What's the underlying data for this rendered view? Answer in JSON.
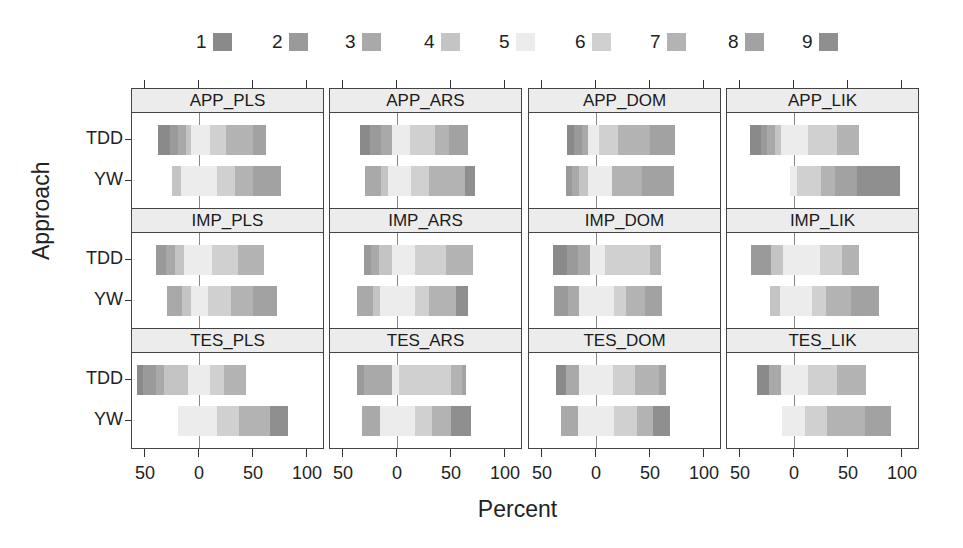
{
  "chart_data": {
    "type": "bar",
    "subtype": "diverging-stacked-likert",
    "xlabel": "Percent",
    "ylabel": "Approach",
    "x_ticks": [
      "50",
      "0",
      "50",
      "100"
    ],
    "x_tick_values": [
      -50,
      0,
      50,
      100
    ],
    "xlim": [
      -63,
      100
    ],
    "categories": [
      "TDD",
      "YW"
    ],
    "legend": {
      "position": "top",
      "levels": [
        "1",
        "2",
        "3",
        "4",
        "5",
        "6",
        "7",
        "8",
        "9"
      ],
      "colors": [
        "#8a8a8a",
        "#9a9a9a",
        "#a9a9a9",
        "#c4c4c4",
        "#ececec",
        "#d0d0d0",
        "#b3b3b3",
        "#a2a2a2",
        "#8f8f8f"
      ]
    },
    "panels": [
      {
        "title": "APP_PLS",
        "bars": {
          "TDD": [
            [
              -38,
              -27,
              1
            ],
            [
              -27,
              -19,
              2
            ],
            [
              -19,
              -12,
              3
            ],
            [
              -12,
              -7,
              4
            ],
            [
              -7,
              10,
              5
            ],
            [
              10,
              25,
              6
            ],
            [
              25,
              50,
              7
            ],
            [
              50,
              62,
              8
            ]
          ],
          "YW": [
            [
              -25,
              -17,
              4
            ],
            [
              -17,
              -8,
              5
            ],
            [
              -8,
              17,
              5
            ],
            [
              17,
              33,
              6
            ],
            [
              33,
              50,
              7
            ],
            [
              50,
              75,
              8
            ]
          ]
        }
      },
      {
        "title": "APP_ARS",
        "bars": {
          "TDD": [
            [
              -34,
              -25,
              1
            ],
            [
              -25,
              -15,
              2
            ],
            [
              -15,
              -5,
              3
            ],
            [
              -5,
              12,
              5
            ],
            [
              12,
              35,
              6
            ],
            [
              35,
              48,
              7
            ],
            [
              48,
              65,
              8
            ]
          ],
          "YW": [
            [
              -30,
              -15,
              3
            ],
            [
              -15,
              -8,
              4
            ],
            [
              -8,
              13,
              5
            ],
            [
              13,
              30,
              6
            ],
            [
              30,
              63,
              7
            ],
            [
              63,
              72,
              9
            ]
          ]
        }
      },
      {
        "title": "APP_DOM",
        "bars": {
          "TDD": [
            [
              -27,
              -20,
              1
            ],
            [
              -20,
              -13,
              2
            ],
            [
              -13,
              -7,
              3
            ],
            [
              -7,
              3,
              5
            ],
            [
              3,
              20,
              6
            ],
            [
              20,
              50,
              7
            ],
            [
              50,
              73,
              8
            ]
          ],
          "YW": [
            [
              -28,
              -22,
              2
            ],
            [
              -22,
              -16,
              3
            ],
            [
              -16,
              -7,
              4
            ],
            [
              -7,
              15,
              5
            ],
            [
              15,
              43,
              7
            ],
            [
              43,
              72,
              8
            ]
          ]
        }
      },
      {
        "title": "APP_LIK",
        "bars": {
          "TDD": [
            [
              -41,
              -31,
              1
            ],
            [
              -31,
              -25,
              2
            ],
            [
              -25,
              -18,
              3
            ],
            [
              -18,
              -12,
              4
            ],
            [
              -12,
              13,
              5
            ],
            [
              13,
              40,
              6
            ],
            [
              40,
              60,
              7
            ]
          ],
          "YW": [
            [
              -4,
              3,
              5
            ],
            [
              3,
              25,
              6
            ],
            [
              25,
              38,
              7
            ],
            [
              38,
              58,
              8
            ],
            [
              58,
              82,
              9
            ],
            [
              82,
              98,
              9
            ]
          ]
        }
      },
      {
        "title": "IMP_PLS",
        "bars": {
          "TDD": [
            [
              -40,
              -31,
              2
            ],
            [
              -31,
              -22,
              3
            ],
            [
              -22,
              -14,
              4
            ],
            [
              -14,
              12,
              5
            ],
            [
              12,
              36,
              6
            ],
            [
              36,
              60,
              7
            ]
          ],
          "YW": [
            [
              -30,
              -16,
              3
            ],
            [
              -16,
              -7,
              4
            ],
            [
              -7,
              8,
              5
            ],
            [
              8,
              30,
              6
            ],
            [
              30,
              50,
              7
            ],
            [
              50,
              72,
              8
            ]
          ]
        }
      },
      {
        "title": "IMP_ARS",
        "bars": {
          "TDD": [
            [
              -31,
              -24,
              2
            ],
            [
              -24,
              -17,
              3
            ],
            [
              -17,
              -5,
              4
            ],
            [
              -5,
              17,
              5
            ],
            [
              17,
              45,
              6
            ],
            [
              45,
              70,
              7
            ]
          ],
          "YW": [
            [
              -37,
              -22,
              3
            ],
            [
              -22,
              -16,
              4
            ],
            [
              -16,
              17,
              5
            ],
            [
              17,
              30,
              6
            ],
            [
              30,
              55,
              7
            ],
            [
              55,
              65,
              9
            ]
          ]
        }
      },
      {
        "title": "IMP_DOM",
        "bars": {
          "TDD": [
            [
              -40,
              -27,
              1
            ],
            [
              -27,
              -17,
              2
            ],
            [
              -17,
              -6,
              3
            ],
            [
              -6,
              8,
              5
            ],
            [
              8,
              50,
              6
            ],
            [
              50,
              60,
              7
            ]
          ],
          "YW": [
            [
              -39,
              -26,
              2
            ],
            [
              -26,
              -16,
              3
            ],
            [
              -16,
              17,
              5
            ],
            [
              17,
              28,
              6
            ],
            [
              28,
              45,
              7
            ],
            [
              45,
              61,
              8
            ]
          ]
        }
      },
      {
        "title": "IMP_LIK",
        "bars": {
          "TDD": [
            [
              -40,
              -21,
              2
            ],
            [
              -21,
              -10,
              4
            ],
            [
              -10,
              24,
              5
            ],
            [
              24,
              44,
              6
            ],
            [
              44,
              60,
              7
            ]
          ],
          "YW": [
            [
              -22,
              -13,
              4
            ],
            [
              -13,
              -4,
              5
            ],
            [
              -4,
              17,
              5
            ],
            [
              17,
              30,
              6
            ],
            [
              30,
              53,
              7
            ],
            [
              53,
              78,
              8
            ]
          ]
        }
      },
      {
        "title": "TES_PLS",
        "bars": {
          "TDD": [
            [
              -57,
              -52,
              1
            ],
            [
              -52,
              -40,
              2
            ],
            [
              -40,
              -32,
              3
            ],
            [
              -32,
              -10,
              4
            ],
            [
              -10,
              10,
              5
            ],
            [
              10,
              23,
              6
            ],
            [
              23,
              43,
              7
            ],
            [
              43,
              43,
              8
            ]
          ],
          "YW": [
            [
              -19,
              -9,
              5
            ],
            [
              -9,
              17,
              5
            ],
            [
              17,
              37,
              6
            ],
            [
              37,
              66,
              7
            ],
            [
              66,
              82,
              9
            ]
          ]
        }
      },
      {
        "title": "TES_ARS",
        "bars": {
          "TDD": [
            [
              -37,
              -31,
              2
            ],
            [
              -31,
              -5,
              3
            ],
            [
              -5,
              2,
              5
            ],
            [
              2,
              50,
              6
            ],
            [
              50,
              60,
              7
            ],
            [
              60,
              63,
              8
            ]
          ],
          "YW": [
            [
              -32,
              -16,
              3
            ],
            [
              -16,
              17,
              5
            ],
            [
              17,
              32,
              6
            ],
            [
              32,
              50,
              7
            ],
            [
              50,
              68,
              9
            ]
          ]
        }
      },
      {
        "title": "TES_DOM",
        "bars": {
          "TDD": [
            [
              -37,
              -28,
              1
            ],
            [
              -28,
              -16,
              3
            ],
            [
              -16,
              16,
              5
            ],
            [
              16,
              36,
              6
            ],
            [
              36,
              58,
              7
            ],
            [
              58,
              64,
              8
            ]
          ],
          "YW": [
            [
              -32,
              -17,
              3
            ],
            [
              -17,
              17,
              5
            ],
            [
              17,
              38,
              6
            ],
            [
              38,
              53,
              7
            ],
            [
              53,
              68,
              9
            ]
          ]
        }
      },
      {
        "title": "TES_LIK",
        "bars": {
          "TDD": [
            [
              -34,
              -23,
              1
            ],
            [
              -23,
              -12,
              3
            ],
            [
              -12,
              13,
              5
            ],
            [
              13,
              40,
              6
            ],
            [
              40,
              66,
              7
            ]
          ],
          "YW": [
            [
              -11,
              10,
              5
            ],
            [
              10,
              31,
              6
            ],
            [
              31,
              66,
              7
            ],
            [
              66,
              89,
              8
            ]
          ]
        }
      }
    ]
  },
  "legend_labels": [
    "1",
    "2",
    "3",
    "4",
    "5",
    "6",
    "7",
    "8",
    "9"
  ],
  "axis": {
    "x_title": "Percent",
    "y_title": "Approach",
    "tick_labels": [
      "50",
      "0",
      "50",
      "100"
    ]
  },
  "row_labels": [
    "TDD",
    "YW"
  ]
}
